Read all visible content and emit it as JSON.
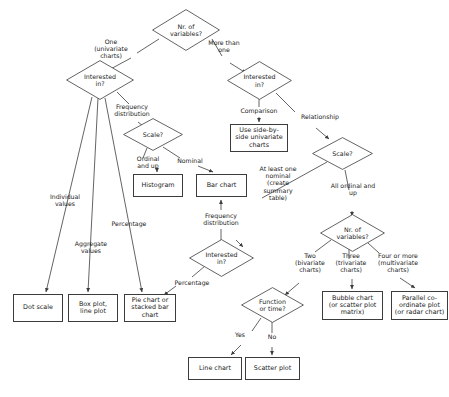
{
  "diagram": {
    "type": "flowchart",
    "stroke_color": "#3c3c3c",
    "background": "#ffffff",
    "nodes": {
      "root_nr_variables": "Nr. of\nvariables?",
      "left_interested_in": "Interested\nin?",
      "left_scale": "Scale?",
      "histogram": "Histogram",
      "bar_chart": "Bar chart",
      "dot_scale": "Dot scale",
      "box_plot": "Box plot,\nline plot",
      "pie_chart": "Pie chart or\nstacked bar\nchart",
      "mid_interested_in": "Interested\nin?",
      "right_interested_in": "Interested\nin?",
      "side_by_side": "Use side-by-\nside univariate\ncharts",
      "right_scale": "Scale?",
      "right_nr_variables": "Nr. of\nvariables?",
      "function_or_time": "Function\nor time?",
      "line_chart": "Line chart",
      "scatter_plot": "Scatter plot",
      "bubble_chart": "Bubble chart\n(or scatter plot\nmatrix)",
      "parallel_plot": "Parallel co-\nordinate plot\n(or radar chart)"
    },
    "edge_labels": {
      "one_univariate": "One\n(univariate\ncharts)",
      "more_than_one": "More than\none",
      "frequency_distribution_left": "Frequency\ndistribution",
      "ordinal_and_up": "Ordinal\nand up",
      "nominal": "Nominal",
      "individual_values": "Individual\nvalues",
      "aggregate_values": "Aggregate\nvalues",
      "percentage_left": "Percentage",
      "frequency_distribution_mid": "Frequency\ndistribution",
      "percentage_mid": "Percentage",
      "comparison": "Comparison",
      "relationship": "Relationship",
      "at_least_one_nominal": "At least one\nnominal\n(create\nsummary\ntable)",
      "all_ordinal_and_up": "All ordinal and\nup",
      "two_bivariate": "Two\n(bivariate\ncharts)",
      "three_trivariate": "Three\n(trivariate\ncharts)",
      "four_or_more": "Four or more\n(multivariate\ncharts)",
      "yes": "Yes",
      "no": "No"
    }
  }
}
